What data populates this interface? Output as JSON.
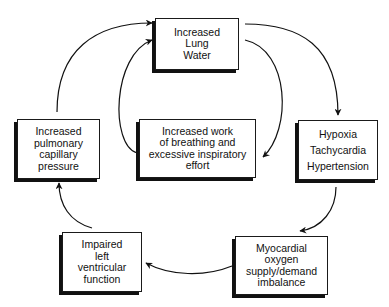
{
  "diagram": {
    "type": "cycle-flowchart",
    "nodes": [
      {
        "id": "lung-water",
        "lines": [
          "Increased",
          "Lung",
          "Water"
        ]
      },
      {
        "id": "hypoxia",
        "lines": [
          "Hypoxia",
          "Tachycardia",
          "Hypertension"
        ]
      },
      {
        "id": "myocardial",
        "lines": [
          "Myocardial",
          "oxygen",
          "supply/demand",
          "imbalance"
        ]
      },
      {
        "id": "lv-function",
        "lines": [
          "Impaired",
          "left",
          "ventricular",
          "function"
        ]
      },
      {
        "id": "pulmonary-pressure",
        "lines": [
          "Increased",
          "pulmonary",
          "capillary",
          "pressure"
        ]
      },
      {
        "id": "work-breathing",
        "lines": [
          "Increased work",
          "of breathing and",
          "excessive inspiratory",
          "effort"
        ]
      }
    ],
    "edges": [
      {
        "from": "lung-water",
        "to": "hypoxia"
      },
      {
        "from": "hypoxia",
        "to": "myocardial"
      },
      {
        "from": "myocardial",
        "to": "lv-function"
      },
      {
        "from": "lv-function",
        "to": "pulmonary-pressure"
      },
      {
        "from": "pulmonary-pressure",
        "to": "lung-water"
      },
      {
        "from": "lung-water",
        "to": "work-breathing"
      },
      {
        "from": "work-breathing",
        "to": "lung-water"
      }
    ],
    "colors": {
      "line": "#111111",
      "box_fill": "#ffffff",
      "shadow": "#111111"
    }
  }
}
